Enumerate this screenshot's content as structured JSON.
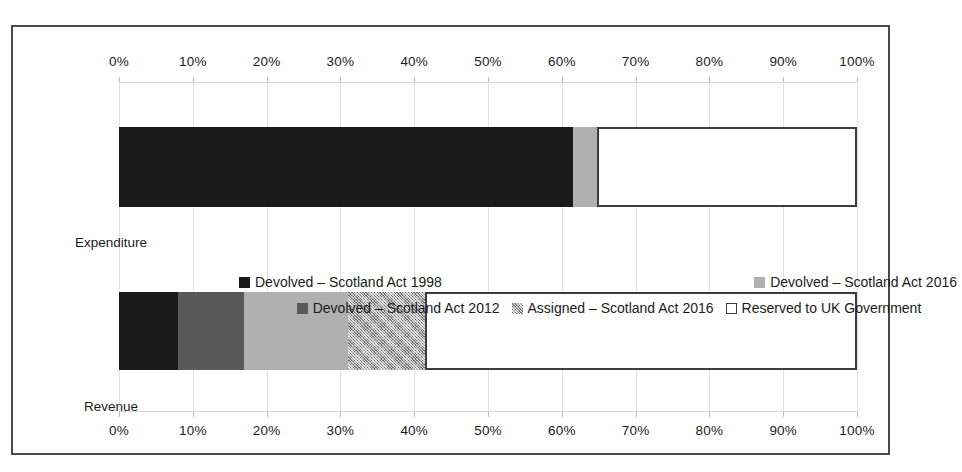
{
  "chart_data": {
    "type": "bar",
    "orientation": "horizontal",
    "stacked": true,
    "stack_mode": "percent",
    "title": "",
    "subtitle": "",
    "xlabel": "",
    "ylabel": "",
    "xlim": [
      0,
      100
    ],
    "grid": true,
    "legend_position": "middle",
    "axis_top_ticks": [
      "0%",
      "10%",
      "20%",
      "30%",
      "40%",
      "50%",
      "60%",
      "70%",
      "80%",
      "90%",
      "100%"
    ],
    "axis_bottom_ticks": [
      "0%",
      "10%",
      "20%",
      "30%",
      "40%",
      "50%",
      "60%",
      "70%",
      "80%",
      "90%",
      "100%"
    ],
    "tick_values": [
      0,
      10,
      20,
      30,
      40,
      50,
      60,
      70,
      80,
      90,
      100
    ],
    "categories": [
      "Expenditure",
      "Revenue"
    ],
    "series": [
      {
        "name": "Devolved – Scotland Act 1998",
        "color": "#1a1a1a",
        "pattern": "solid",
        "values": [
          61.5,
          8.0
        ]
      },
      {
        "name": "Devolved – Scotland Act 2012",
        "color": "#595959",
        "pattern": "solid",
        "values": [
          0.0,
          9.0
        ]
      },
      {
        "name": "Devolved – Scotland Act 2016",
        "color": "#b0b0b0",
        "pattern": "solid",
        "values": [
          3.3,
          14.0
        ]
      },
      {
        "name": "Assigned – Scotland Act 2016",
        "color": "#a8a8a8",
        "pattern": "cross-hatch",
        "values": [
          0.0,
          10.5
        ]
      },
      {
        "name": "Reserved to UK Government",
        "color": "#ffffff",
        "pattern": "outline",
        "values": [
          35.2,
          58.5
        ]
      }
    ]
  },
  "axis": {
    "top": {
      "ticks": [
        "0%",
        "10%",
        "20%",
        "30%",
        "40%",
        "50%",
        "60%",
        "70%",
        "80%",
        "90%",
        "100%"
      ]
    },
    "bottom": {
      "ticks": [
        "0%",
        "10%",
        "20%",
        "30%",
        "40%",
        "50%",
        "60%",
        "70%",
        "80%",
        "90%",
        "100%"
      ]
    }
  },
  "categories": [
    {
      "label": "Expenditure"
    },
    {
      "label": "Revenue"
    }
  ],
  "legend": {
    "row1": [
      {
        "label": "Devolved – Scotland Act 1998",
        "swatch": "fill-devolved-1998"
      },
      {
        "label": "Devolved – Scotland Act 2016",
        "swatch": "fill-devolved-2016"
      }
    ],
    "row2": [
      {
        "label": "Devolved – Scotland Act 2012",
        "swatch": "fill-devolved-2012"
      },
      {
        "label": "Assigned – Scotland Act 2016",
        "swatch": "fill-assigned-2016"
      },
      {
        "label": "Reserved to UK Government",
        "swatch": "fill-reserved"
      }
    ]
  },
  "colors": {
    "devolved_1998": "#1a1a1a",
    "devolved_2012": "#595959",
    "devolved_2016": "#b0b0b0",
    "assigned_2016": "#a8a8a8",
    "reserved": "#ffffff",
    "frame": "#4a4a4a",
    "gridline": "#e2e2e2"
  }
}
